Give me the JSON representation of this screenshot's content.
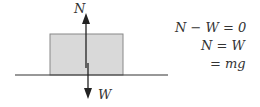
{
  "diagram": {
    "labels": {
      "normal_force": "N",
      "weight": "W"
    },
    "colors": {
      "block_fill": "#d9d9d9",
      "block_stroke": "#888888",
      "line": "#333333"
    }
  },
  "equations": {
    "line1": "N − W = 0",
    "line2": "N = W",
    "line3": "= mg"
  }
}
